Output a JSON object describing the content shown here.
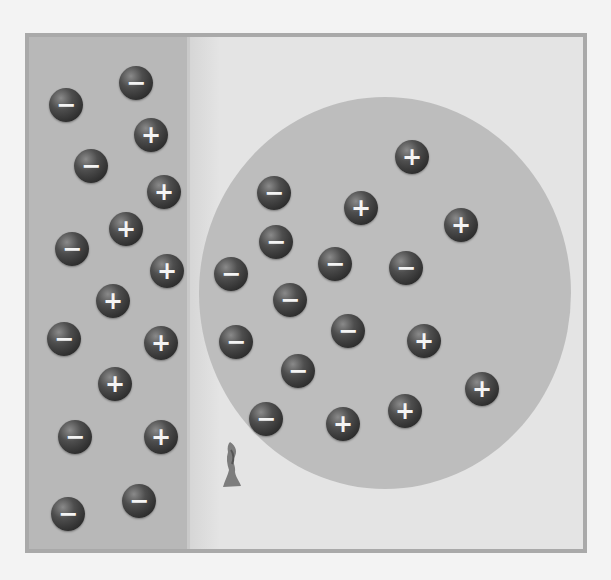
{
  "figure": {
    "colors": {
      "background": "#f3f3f3",
      "frame_border": "#a9a9a9",
      "wall": "#b8b8b8",
      "air": "#e4e4e4",
      "balloon": "#bdbdbd",
      "charge": "#333333"
    },
    "wall_charges": [
      {
        "sign": "−",
        "x": 62,
        "y": 101
      },
      {
        "sign": "−",
        "x": 132,
        "y": 79
      },
      {
        "sign": "+",
        "x": 147,
        "y": 131
      },
      {
        "sign": "−",
        "x": 87,
        "y": 162
      },
      {
        "sign": "+",
        "x": 160,
        "y": 188
      },
      {
        "sign": "+",
        "x": 122,
        "y": 225
      },
      {
        "sign": "−",
        "x": 68,
        "y": 245
      },
      {
        "sign": "+",
        "x": 163,
        "y": 267
      },
      {
        "sign": "+",
        "x": 109,
        "y": 297
      },
      {
        "sign": "−",
        "x": 60,
        "y": 335
      },
      {
        "sign": "+",
        "x": 157,
        "y": 339
      },
      {
        "sign": "+",
        "x": 111,
        "y": 380
      },
      {
        "sign": "−",
        "x": 71,
        "y": 433
      },
      {
        "sign": "+",
        "x": 157,
        "y": 433
      },
      {
        "sign": "−",
        "x": 135,
        "y": 497
      },
      {
        "sign": "−",
        "x": 64,
        "y": 510
      }
    ],
    "balloon_charges": [
      {
        "sign": "+",
        "x": 408,
        "y": 153
      },
      {
        "sign": "−",
        "x": 270,
        "y": 189
      },
      {
        "sign": "+",
        "x": 357,
        "y": 204
      },
      {
        "sign": "+",
        "x": 457,
        "y": 221
      },
      {
        "sign": "−",
        "x": 272,
        "y": 238
      },
      {
        "sign": "−",
        "x": 331,
        "y": 260
      },
      {
        "sign": "−",
        "x": 402,
        "y": 264
      },
      {
        "sign": "−",
        "x": 227,
        "y": 270
      },
      {
        "sign": "−",
        "x": 286,
        "y": 296
      },
      {
        "sign": "−",
        "x": 344,
        "y": 327
      },
      {
        "sign": "−",
        "x": 232,
        "y": 338
      },
      {
        "sign": "+",
        "x": 420,
        "y": 337
      },
      {
        "sign": "−",
        "x": 294,
        "y": 367
      },
      {
        "sign": "+",
        "x": 478,
        "y": 385
      },
      {
        "sign": "−",
        "x": 262,
        "y": 415
      },
      {
        "sign": "+",
        "x": 339,
        "y": 420
      },
      {
        "sign": "+",
        "x": 401,
        "y": 407
      }
    ]
  }
}
